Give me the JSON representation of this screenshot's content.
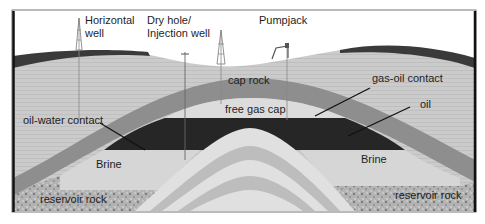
{
  "diagram": {
    "labels": {
      "horizontal_well_1": "Horizontal",
      "horizontal_well_2": "well",
      "dry_hole_1": "Dry hole/",
      "dry_hole_2": "Injection well",
      "pumpjack": "Pumpjack",
      "cap_rock": "cap rock",
      "gas_oil_contact": "gas-oil contact",
      "free_gas_cap": "free gas cap",
      "oil": "oil",
      "oil_water_contact": "oil-water contact",
      "brine_left": "Brine",
      "brine_right": "Brine",
      "reservoir_rock_left": "reservoir rock",
      "reservoir_rock_right": "reservoir rock"
    },
    "colors": {
      "sky": "#ffffff",
      "topsoil": "#3c3c3c",
      "overburden": "#c9c9c9",
      "cap_rock": "#8e8e8e",
      "free_gas_cap": "#dcdcdc",
      "oil": "#262626",
      "brine": "#d6d6d6",
      "reservoir_rock": "#a8a8a8",
      "core_light": "#e0e0e0",
      "core_dark": "#bdbdbd",
      "frame": "#111111"
    }
  }
}
